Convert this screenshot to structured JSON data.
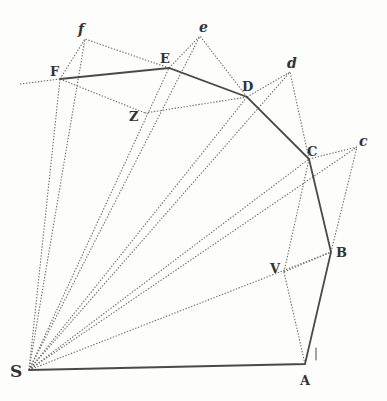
{
  "diagram": {
    "type": "geometric construction",
    "colors": {
      "solid_line": "#4a4a4a",
      "dotted_line": "#6e6e6e",
      "label": "#333333",
      "background": "#fdfdfc"
    },
    "points": {
      "S": {
        "label": "S",
        "x": 29,
        "y": 370
      },
      "A": {
        "label": "A",
        "x": 305,
        "y": 364
      },
      "B": {
        "label": "B",
        "x": 331,
        "y": 252
      },
      "C": {
        "label": "C",
        "x": 309,
        "y": 159
      },
      "D": {
        "label": "D",
        "x": 247,
        "y": 97
      },
      "E": {
        "label": "E",
        "x": 169,
        "y": 68
      },
      "F": {
        "label": "F",
        "x": 60,
        "y": 79
      },
      "c": {
        "label": "c",
        "x": 357,
        "y": 147
      },
      "d": {
        "label": "d",
        "x": 290,
        "y": 72
      },
      "e": {
        "label": "e",
        "x": 200,
        "y": 36
      },
      "f": {
        "label": "f",
        "x": 85,
        "y": 39
      },
      "V": {
        "label": "V",
        "x": 284,
        "y": 272
      },
      "Z": {
        "label": "Z",
        "x": 145,
        "y": 113
      }
    },
    "solid_path": [
      "S",
      "A",
      "B",
      "C",
      "D",
      "E",
      "F"
    ],
    "dotted_segments": [
      [
        "S",
        "B"
      ],
      [
        "S",
        "C"
      ],
      [
        "S",
        "D"
      ],
      [
        "S",
        "E"
      ],
      [
        "S",
        "F"
      ],
      [
        "S",
        "c"
      ],
      [
        "S",
        "d"
      ],
      [
        "S",
        "e"
      ],
      [
        "S",
        "f"
      ],
      [
        "B",
        "c"
      ],
      [
        "C",
        "c"
      ],
      [
        "C",
        "d"
      ],
      [
        "D",
        "d"
      ],
      [
        "D",
        "e"
      ],
      [
        "E",
        "e"
      ],
      [
        "E",
        "f"
      ],
      [
        "F",
        "f"
      ],
      [
        "A",
        "V"
      ],
      [
        "V",
        "C"
      ],
      [
        "V",
        "B"
      ],
      [
        "F",
        "Z"
      ],
      [
        "Z",
        "D"
      ]
    ],
    "arrow_mark": {
      "near": "A",
      "glyph": "↑"
    }
  }
}
